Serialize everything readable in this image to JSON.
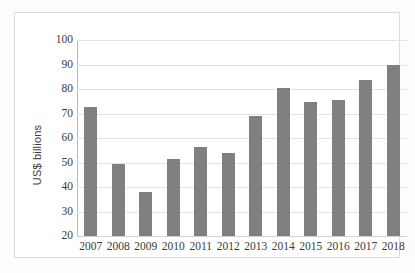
{
  "chart_data": {
    "type": "bar",
    "title": "",
    "xlabel": "",
    "ylabel": "US$ billions",
    "categories": [
      "2007",
      "2008",
      "2009",
      "2010",
      "2011",
      "2012",
      "2013",
      "2014",
      "2015",
      "2016",
      "2017",
      "2018"
    ],
    "values": [
      72.5,
      49.5,
      38.0,
      51.5,
      56.5,
      54.0,
      69.0,
      80.5,
      74.5,
      75.5,
      83.5,
      90.0
    ],
    "ylim": [
      20,
      100
    ],
    "ytick_labels": [
      "100",
      "90",
      "80",
      "70",
      "60",
      "50",
      "40",
      "30",
      "20"
    ],
    "ytick_values": [
      100,
      90,
      80,
      70,
      60,
      50,
      40,
      30,
      20
    ],
    "grid": true,
    "legend": "none",
    "bar_color": "#808080",
    "gridline_color": "#e3e3e3",
    "axis_color": "#b9b9b9"
  }
}
